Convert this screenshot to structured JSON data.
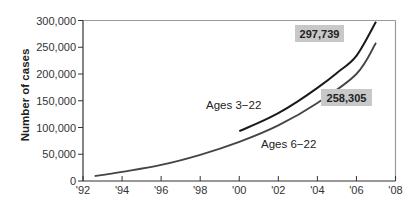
{
  "chart_data": {
    "type": "line",
    "title": "",
    "xlabel": "",
    "ylabel": "Number of cases",
    "xlim": [
      92,
      108
    ],
    "ylim": [
      0,
      300000
    ],
    "grid": false,
    "legend": "inline labels",
    "x_ticks": [
      "'92",
      "'94",
      "'96",
      "'98",
      "'00",
      "'02",
      "'04",
      "'06",
      "'08"
    ],
    "y_ticks": [
      "0",
      "50,000",
      "100,000",
      "150,000",
      "200,000",
      "250,000",
      "300,000"
    ],
    "series": [
      {
        "name": "Ages 3−22",
        "color": "#1a1a1a",
        "x": [
          100,
          101,
          102,
          103,
          104,
          105,
          106,
          107
        ],
        "values": [
          93000,
          109000,
          127000,
          149000,
          174000,
          202000,
          234000,
          297739
        ],
        "end_label": "297,739"
      },
      {
        "name": "Ages 6−22",
        "color": "#444444",
        "x": [
          92.6,
          94,
          96,
          98,
          100,
          102,
          104,
          106,
          107
        ],
        "values": [
          9000,
          17000,
          30000,
          49000,
          73000,
          104000,
          146000,
          200000,
          258305
        ],
        "end_label": "258,305"
      }
    ],
    "annotations": [
      "297,739",
      "258,305"
    ]
  },
  "labels": {
    "y_title": "Number of cases",
    "series_a": "Ages 3−22",
    "series_b": "Ages 6−22",
    "value_a": "297,739",
    "value_b": "258,305"
  },
  "colors": {
    "axis": "#333333",
    "frame": "#9a9a9a",
    "label_box": "#c8c8c8"
  }
}
